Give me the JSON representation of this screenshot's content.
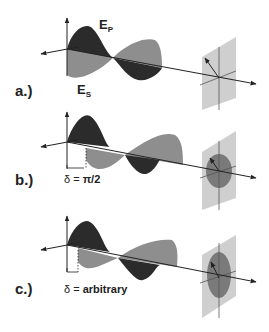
{
  "figure": {
    "colors": {
      "background": "#ffffff",
      "wave_p": "#2b2b2b",
      "wave_s": "#8e8e8e",
      "axis": "#222222",
      "screen": "#cfcfcf",
      "ellipse": "#7a7a7a"
    },
    "panels": [
      {
        "label": "a.)",
        "title": "linear polarization",
        "field_p": {
          "main": "E",
          "sub": "P"
        },
        "field_s": {
          "main": "E",
          "sub": "S"
        },
        "delta_symbol": "",
        "delta_value": "",
        "projection": "line"
      },
      {
        "label": "b.)",
        "field_p": {
          "main": "",
          "sub": ""
        },
        "field_s": {
          "main": "",
          "sub": ""
        },
        "delta_symbol": "δ = ",
        "delta_value": "π/2",
        "projection": "circle"
      },
      {
        "label": "c.)",
        "field_p": {
          "main": "",
          "sub": ""
        },
        "field_s": {
          "main": "",
          "sub": ""
        },
        "delta_symbol": "δ = ",
        "delta_value": "arbitrary",
        "projection": "ellipse"
      }
    ]
  }
}
